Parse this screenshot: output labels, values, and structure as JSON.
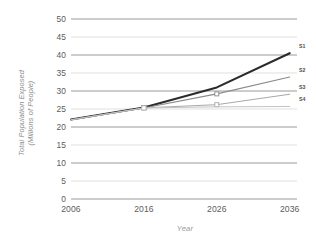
{
  "chart_data": {
    "type": "line",
    "title": "",
    "xlabel": "Year",
    "ylabel": "Total Population Exposed\n(Millions of People)",
    "ylabel_line1": "Total Population Exposed",
    "ylabel_line2": "(Millions of People)",
    "x": [
      2006,
      2016,
      2026,
      2036
    ],
    "categories": [
      "2006",
      "2016",
      "2026",
      "2036"
    ],
    "xlim": [
      2006,
      2037
    ],
    "ylim": [
      0,
      50
    ],
    "ytick_values": [
      0,
      5,
      10,
      15,
      20,
      25,
      30,
      35,
      40,
      45,
      50
    ],
    "ytick_labels": [
      "0",
      "5",
      "10",
      "15",
      "20",
      "25",
      "30",
      "35",
      "40",
      "45",
      "50"
    ],
    "xtick_labels": [
      "2006",
      "2016",
      "2026",
      "2036"
    ],
    "grid": true,
    "grid_major_values": [
      0,
      10,
      20,
      30,
      40,
      50
    ],
    "grid_minor_values": [
      5,
      15,
      25,
      35,
      45
    ],
    "grid_major_color": "#8f8f8f",
    "grid_minor_color": "#d2d2d2",
    "legend_position": "right-inline",
    "series": [
      {
        "name": "S1",
        "label": "S1",
        "color": "#2b2b2b",
        "width": 2.1,
        "values": [
          22.1,
          25.4,
          31.0,
          40.5
        ],
        "markers": [
          false,
          true,
          false,
          false
        ],
        "label_value": 40.5
      },
      {
        "name": "S2",
        "label": "S2",
        "color": "#8a8a8a",
        "width": 1.1,
        "values": [
          22.0,
          25.3,
          29.2,
          33.9
        ],
        "markers": [
          false,
          true,
          true,
          false
        ],
        "label_value": 33.9
      },
      {
        "name": "S3",
        "label": "S3",
        "color": "#a8a8a8",
        "width": 1.0,
        "values": [
          22.0,
          25.3,
          26.2,
          29.1
        ],
        "markers": [
          false,
          true,
          true,
          false
        ],
        "label_value": 29.1
      },
      {
        "name": "S4",
        "label": "S4",
        "color": "#c4c4c4",
        "width": 1.0,
        "values": [
          22.0,
          25.3,
          25.6,
          25.7
        ],
        "markers": [
          false,
          true,
          false,
          false
        ],
        "label_value": 25.7
      }
    ]
  }
}
